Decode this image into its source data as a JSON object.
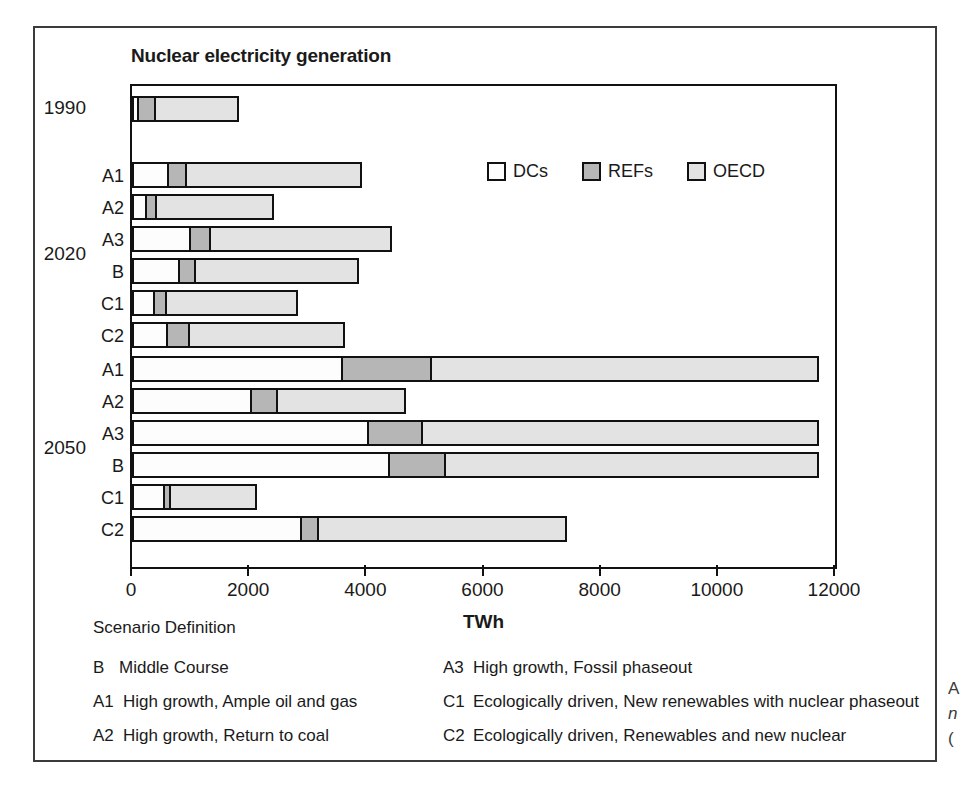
{
  "chart_data": {
    "type": "bar",
    "orientation": "horizontal",
    "stacked": true,
    "title": "Nuclear electricity generation",
    "xlabel": "TWh",
    "ylabel": "",
    "xlim": [
      0,
      12000
    ],
    "xticks": [
      0,
      2000,
      4000,
      6000,
      8000,
      10000,
      12000
    ],
    "xtick_labels": [
      "0",
      "2000",
      "4000",
      "6000",
      "8000",
      "10000",
      "12000"
    ],
    "grid": false,
    "legend_position": "upper right inside plot",
    "series": [
      {
        "name": "DCs",
        "color": "#fdfdfd"
      },
      {
        "name": "REFs",
        "color": "#b6b6b6"
      },
      {
        "name": "OECD",
        "color": "#e3e3e3"
      }
    ],
    "groups": [
      {
        "label": "1990",
        "rows": [
          {
            "label": "",
            "DCs": 120,
            "REFs": 330,
            "OECD": 1450,
            "total": 1900
          }
        ]
      },
      {
        "label": "2020",
        "rows": [
          {
            "label": "A1",
            "DCs": 630,
            "REFs": 340,
            "OECD": 3030,
            "total": 4000
          },
          {
            "label": "A2",
            "DCs": 260,
            "REFs": 200,
            "OECD": 2040,
            "total": 2500
          },
          {
            "label": "A3",
            "DCs": 1000,
            "REFs": 380,
            "OECD": 3120,
            "total": 4500
          },
          {
            "label": "B",
            "DCs": 820,
            "REFs": 300,
            "OECD": 2830,
            "total": 3950
          },
          {
            "label": "C1",
            "DCs": 400,
            "REFs": 230,
            "OECD": 2270,
            "total": 2900
          },
          {
            "label": "C2",
            "DCs": 620,
            "REFs": 400,
            "OECD": 2680,
            "total": 3700
          }
        ]
      },
      {
        "label": "2050",
        "rows": [
          {
            "label": "A1",
            "DCs": 3600,
            "REFs": 1550,
            "OECD": 6650,
            "total": 11800
          },
          {
            "label": "A2",
            "DCs": 2050,
            "REFs": 480,
            "OECD": 2220,
            "total": 4750
          },
          {
            "label": "A3",
            "DCs": 4050,
            "REFs": 950,
            "OECD": 6800,
            "total": 11800
          },
          {
            "label": "B",
            "DCs": 4400,
            "REFs": 1000,
            "OECD": 6400,
            "total": 11800
          },
          {
            "label": "C1",
            "DCs": 560,
            "REFs": 140,
            "OECD": 1500,
            "total": 2200
          },
          {
            "label": "C2",
            "DCs": 2900,
            "REFs": 330,
            "OECD": 4270,
            "total": 7500
          }
        ]
      }
    ]
  },
  "legend": {
    "items": [
      {
        "label": "DCs",
        "color": "#fdfdfd"
      },
      {
        "label": "REFs",
        "color": "#b6b6b6"
      },
      {
        "label": "OECD",
        "color": "#e3e3e3"
      }
    ]
  },
  "scenario": {
    "heading": "Scenario Definition",
    "left": [
      {
        "code": "B",
        "text": "Middle Course"
      },
      {
        "code": "A1",
        "text": "High growth, Ample oil and gas"
      },
      {
        "code": "A2",
        "text": "High growth, Return to coal"
      }
    ],
    "right": [
      {
        "code": "A3",
        "text": "High growth, Fossil phaseout"
      },
      {
        "code": "C1",
        "text": "Ecologically driven, New renewables with nuclear phaseout"
      },
      {
        "code": "C2",
        "text": "Ecologically driven, Renewables and new nuclear"
      }
    ]
  },
  "edge_caption": {
    "line1": "A",
    "line2": "n",
    "line3": "("
  }
}
